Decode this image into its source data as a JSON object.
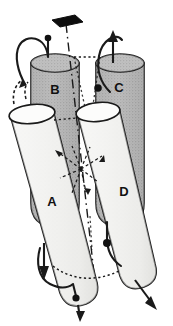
{
  "figure": {
    "background_color": "#ffffff",
    "ink_color": "#111111",
    "helix_front_fill": "#f0f0ee",
    "helix_back_fill": "#b3b3b3",
    "helix_cap_fill": "#c9c9c9",
    "shadow_fill": "#9a9a9a"
  },
  "helices": [
    {
      "id": "A",
      "label": "A",
      "position": "front-left",
      "direction": "down",
      "fill": "#f0f0ee"
    },
    {
      "id": "B",
      "label": "B",
      "position": "back-left",
      "direction": "down",
      "fill": "#b3b3b3"
    },
    {
      "id": "C",
      "label": "C",
      "position": "back-right",
      "direction": "up",
      "fill": "#b3b3b3"
    },
    {
      "id": "D",
      "label": "D",
      "position": "front-right",
      "direction": "down",
      "fill": "#f0f0ee"
    }
  ],
  "symmetry": {
    "axis_marker": "two-fold-axis-lens",
    "axis_marker_color": "#111111",
    "axis_line_style": "dash-dot",
    "center_rays": 8,
    "ray_style": "dashed"
  },
  "connections": [
    {
      "id": "top-left-loop",
      "style": "solid",
      "terminus": "filled-circle"
    },
    {
      "id": "top-left-hidden",
      "style": "dashed",
      "terminus": "arrow-up"
    },
    {
      "id": "top-right-loop",
      "style": "solid",
      "terminus": "arrow-up"
    },
    {
      "id": "top-back-link",
      "style": "dotted",
      "terminus": "none"
    },
    {
      "id": "bottom-left-loop",
      "style": "solid",
      "terminus": "arrow-down"
    },
    {
      "id": "bottom-right-loop",
      "style": "solid",
      "terminus": "arrow-down-right"
    },
    {
      "id": "bottom-back-link",
      "style": "dotted",
      "terminus": "none"
    }
  ],
  "markers": [
    {
      "id": "marker-top-b",
      "shape": "filled-circle"
    },
    {
      "id": "marker-mid-c",
      "shape": "filled-circle"
    },
    {
      "id": "marker-bottom-b",
      "shape": "filled-circle"
    },
    {
      "id": "marker-bottom-a",
      "shape": "filled-circle"
    }
  ]
}
